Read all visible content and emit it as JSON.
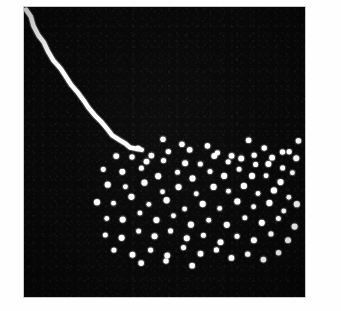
{
  "figure": {
    "kind": "photographic-plate",
    "panel": {
      "x": 24,
      "y": 7,
      "width": 281,
      "height": 290
    },
    "background_color": "#ffffff",
    "plate_color": "#080808",
    "feature_color": "#ffffff",
    "border_color": "#c9c9c9"
  },
  "chart_data": {
    "type": "scatter",
    "title": "",
    "subtitle": "",
    "xlabel": "",
    "ylabel": "",
    "grid": false,
    "legend_position": "none",
    "axis_visible": false,
    "tick_labels_x": [],
    "tick_labels_y": [],
    "xlim": [
      0,
      281
    ],
    "ylim": [
      0,
      290
    ],
    "annotations": [],
    "series": [
      {
        "name": "track-streak",
        "kind": "line",
        "color": "#ffffff",
        "stroke_width": 4.6,
        "points": [
          [
            2,
            2
          ],
          [
            6,
            10
          ],
          [
            10,
            19
          ],
          [
            15,
            28
          ],
          [
            19,
            36
          ],
          [
            24,
            44
          ],
          [
            30,
            53
          ],
          [
            36,
            62
          ],
          [
            42,
            70
          ],
          [
            48,
            78
          ],
          [
            53,
            85
          ],
          [
            59,
            93
          ],
          [
            65,
            101
          ],
          [
            71,
            108
          ],
          [
            77,
            115
          ],
          [
            83,
            122
          ],
          [
            89,
            128
          ],
          [
            95,
            133
          ],
          [
            101,
            137
          ],
          [
            107,
            140
          ],
          [
            112,
            142
          ],
          [
            117,
            143
          ]
        ]
      },
      {
        "name": "dot-shower",
        "kind": "scatter",
        "color": "#ffffff",
        "marker": "circle",
        "marker_size": 5.6,
        "count": 104,
        "points": [
          [
            139,
            130
          ],
          [
            113,
            140
          ],
          [
            156,
            138
          ],
          [
            181,
            141
          ],
          [
            222,
            135
          ],
          [
            238,
            141
          ],
          [
            273,
            132
          ],
          [
            258,
            143
          ],
          [
            128,
            148
          ],
          [
            146,
            146
          ],
          [
            168,
            145
          ],
          [
            196,
            147
          ],
          [
            210,
            148
          ],
          [
            232,
            146
          ],
          [
            249,
            149
          ],
          [
            265,
            145
          ],
          [
            91,
            151
          ],
          [
            106,
            152
          ],
          [
            120,
            155
          ],
          [
            137,
            152
          ],
          [
            159,
            154
          ],
          [
            175,
            156
          ],
          [
            190,
            150
          ],
          [
            205,
            157
          ],
          [
            219,
            153
          ],
          [
            234,
            157
          ],
          [
            247,
            155
          ],
          [
            261,
            159
          ],
          [
            274,
            151
          ],
          [
            80,
            164
          ],
          [
            98,
            167
          ],
          [
            116,
            162
          ],
          [
            132,
            168
          ],
          [
            151,
            163
          ],
          [
            166,
            170
          ],
          [
            184,
            165
          ],
          [
            199,
            171
          ],
          [
            215,
            164
          ],
          [
            229,
            169
          ],
          [
            244,
            167
          ],
          [
            259,
            173
          ],
          [
            271,
            165
          ],
          [
            86,
            179
          ],
          [
            103,
            182
          ],
          [
            121,
            177
          ],
          [
            138,
            184
          ],
          [
            153,
            178
          ],
          [
            170,
            185
          ],
          [
            187,
            180
          ],
          [
            202,
            186
          ],
          [
            218,
            181
          ],
          [
            233,
            187
          ],
          [
            250,
            182
          ],
          [
            266,
            188
          ],
          [
            75,
            194
          ],
          [
            92,
            197
          ],
          [
            110,
            192
          ],
          [
            127,
            199
          ],
          [
            144,
            193
          ],
          [
            161,
            200
          ],
          [
            178,
            195
          ],
          [
            194,
            201
          ],
          [
            211,
            196
          ],
          [
            227,
            202
          ],
          [
            243,
            197
          ],
          [
            258,
            203
          ],
          [
            272,
            195
          ],
          [
            83,
            210
          ],
          [
            100,
            213
          ],
          [
            118,
            208
          ],
          [
            135,
            215
          ],
          [
            152,
            209
          ],
          [
            169,
            216
          ],
          [
            186,
            211
          ],
          [
            203,
            217
          ],
          [
            220,
            212
          ],
          [
            236,
            218
          ],
          [
            252,
            213
          ],
          [
            268,
            219
          ],
          [
            79,
            226
          ],
          [
            96,
            229
          ],
          [
            114,
            224
          ],
          [
            131,
            231
          ],
          [
            148,
            226
          ],
          [
            165,
            232
          ],
          [
            182,
            227
          ],
          [
            199,
            233
          ],
          [
            215,
            228
          ],
          [
            231,
            234
          ],
          [
            247,
            229
          ],
          [
            263,
            235
          ],
          [
            88,
            243
          ],
          [
            106,
            246
          ],
          [
            124,
            241
          ],
          [
            141,
            248
          ],
          [
            158,
            242
          ],
          [
            176,
            249
          ],
          [
            193,
            244
          ],
          [
            209,
            250
          ],
          [
            226,
            245
          ],
          [
            242,
            251
          ],
          [
            257,
            246
          ],
          [
            119,
            258
          ],
          [
            143,
            256
          ],
          [
            168,
            259
          ]
        ]
      }
    ]
  }
}
